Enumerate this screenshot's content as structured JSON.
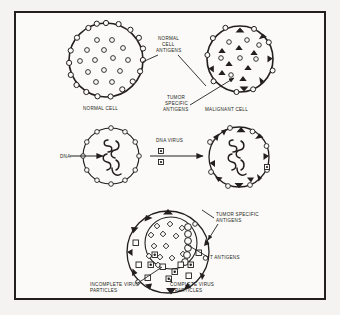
{
  "figure": {
    "title_visible": false,
    "background_color": "#f4f3f1",
    "panel_color": "#fbfaf8",
    "ink_color": "#231f20",
    "frame_border_color": "#231f20"
  },
  "labels": {
    "normal_cell_antigens": [
      "NORMAL",
      "CELL",
      "ANTIGENS"
    ],
    "normal_cell": "NORMAL CELL",
    "tumor_specific_antigens_top": [
      "TUMOR",
      "SPECIFIC",
      "ANTIGENS"
    ],
    "malignant_cell": "MALIGNANT CELL",
    "dna": "DNA",
    "dna_virus": "DNA VIRUS",
    "tumor_specific_antigens_bottom": [
      "TUMOR SPECIFIC",
      "ANTIGENS"
    ],
    "t_antigens": "T ANTIGENS",
    "incomplete_virus_particles": [
      "INCOMPLETE VIRUS",
      "PARTICLES"
    ],
    "complete_virus_particles": [
      "COMPLETE VIRUS",
      "PARTICLES"
    ]
  },
  "cells": {
    "normal_cell": {
      "name": "normal-cell",
      "cx": 106,
      "cy": 60,
      "r": 37,
      "membrane_markers": {
        "shape": "open-circle",
        "count": 18
      },
      "interior_markers": {
        "shape": "open-circle",
        "count": 14
      }
    },
    "malignant_cell": {
      "name": "malignant-cell",
      "cx": 240,
      "cy": 59,
      "r": 33,
      "membrane_markers": {
        "open_circle_count": 9,
        "filled_triangle_count": 6
      },
      "interior_markers": {
        "open_circle_count": 7,
        "filled_triangle_count": 7
      }
    },
    "dna_cell": {
      "name": "dna-infected-cell",
      "cx": 111,
      "cy": 156,
      "r": 28,
      "membrane_markers": {
        "shape": "open-circle",
        "count": 12
      },
      "interior_content": "dna-helix"
    },
    "transformed_cell": {
      "name": "transformed-cell",
      "cx": 239,
      "cy": 157,
      "r": 30,
      "membrane_markers": {
        "open_circle_count": 8,
        "filled_triangle_count": 10,
        "virus_square_count": 1
      },
      "interior_content": "dna-helix"
    },
    "virus_producing_cell": {
      "name": "virus-producing-cell",
      "cx": 168,
      "cy": 252,
      "r": 41,
      "nucleus": {
        "cx": 171,
        "cy": 243,
        "r": 26
      },
      "membrane_markers": {
        "filled_triangle_count": 10,
        "open_circle_count": 3
      },
      "nucleus_markers": {
        "t_antigen_count": 14,
        "dna_chain_circles": 6
      },
      "cytoplasm_markers": {
        "complete_virus_count": 5,
        "incomplete_virus_count": 7
      }
    }
  },
  "legend_symbols": {
    "open_circle": "normal cell antigen",
    "filled_triangle": "tumor specific antigen",
    "small_square": "incomplete virus particle",
    "square_with_dot": "complete virus particle",
    "diamond": "T antigen"
  }
}
